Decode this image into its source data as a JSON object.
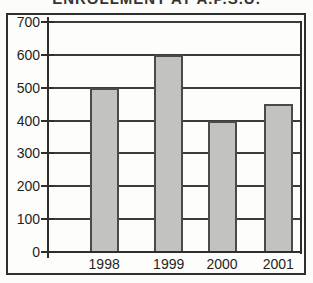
{
  "chart_data": {
    "type": "bar",
    "title": "ENROLLMENT AT A.P.S.U.",
    "categories": [
      "1998",
      "1999",
      "2000",
      "2001"
    ],
    "values": [
      500,
      600,
      400,
      450
    ],
    "xlabel": "",
    "ylabel": "",
    "ylim": [
      0,
      700
    ],
    "yticks": [
      0,
      100,
      200,
      300,
      400,
      500,
      600,
      700
    ],
    "grid": true,
    "legend": false,
    "colors": {
      "bar_fill": "#c2c2c0",
      "bar_border": "#4a4a4a",
      "gridline": "#3c3c3c",
      "axis": "#2e2e2e",
      "frame": "#2f2f2f",
      "text": "#1f1f1f",
      "background": "#fcfcfa"
    }
  }
}
